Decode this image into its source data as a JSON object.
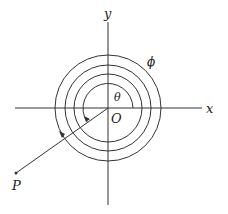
{
  "diagram": {
    "labels": {
      "x_axis": "x",
      "y_axis": "y",
      "origin": "O",
      "point": "P",
      "inner_angle": "θ",
      "outer_angle": "ϕ"
    },
    "colors": {
      "stroke": "#333333",
      "background": "#ffffff"
    }
  }
}
